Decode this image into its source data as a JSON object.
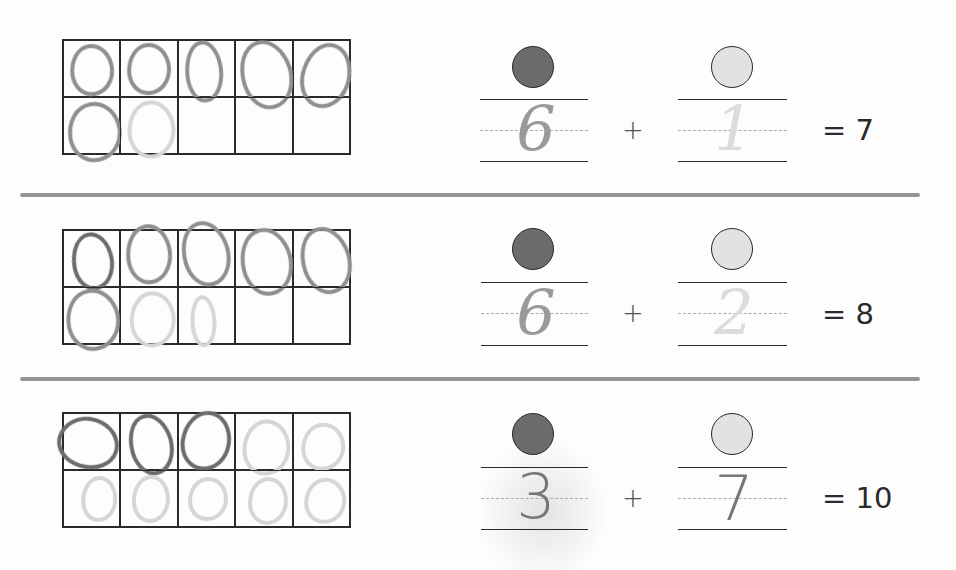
{
  "worksheet": {
    "colors": {
      "dark_circle": "#6b6b6b",
      "light_circle": "#e2e2e2",
      "divider": "#8a8a8a",
      "pencil": "#8f8f8f",
      "ink": "#2a2a2a"
    },
    "rows": [
      {
        "tenframe": {
          "filled_cells": [
            1,
            1,
            1,
            1,
            1,
            1,
            1,
            0,
            0,
            0
          ],
          "faint_cells": [
            0,
            0,
            0,
            0,
            0,
            0,
            1,
            0,
            0,
            0
          ]
        },
        "dark_count_written": "6",
        "light_count_written": "1",
        "plus": "+",
        "total_label": "= 7"
      },
      {
        "tenframe": {
          "filled_cells": [
            1,
            1,
            1,
            1,
            1,
            1,
            1,
            1,
            0,
            0
          ],
          "faint_cells": [
            0,
            0,
            0,
            0,
            0,
            0,
            1,
            1,
            0,
            0
          ]
        },
        "dark_count_written": "6",
        "light_count_written": "2",
        "plus": "+",
        "total_label": "= 8"
      },
      {
        "tenframe": {
          "filled_cells": [
            1,
            1,
            1,
            1,
            1,
            1,
            1,
            1,
            1,
            1
          ],
          "faint_cells": [
            0,
            0,
            0,
            1,
            1,
            1,
            1,
            1,
            1,
            1
          ]
        },
        "dark_count_written": "3",
        "light_count_written": "7",
        "plus": "+",
        "total_label": "= 10"
      }
    ]
  }
}
